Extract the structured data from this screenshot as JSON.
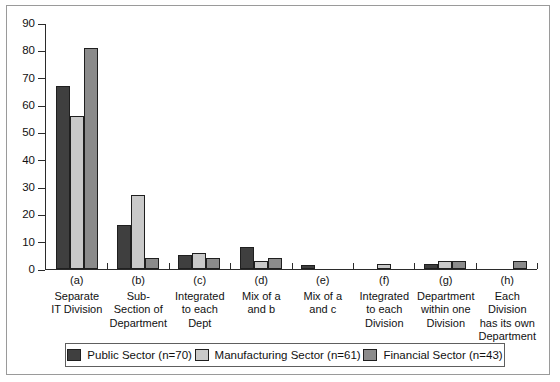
{
  "chart_data": {
    "type": "bar",
    "title": "",
    "xlabel": "",
    "ylabel": "",
    "ylim": [
      0,
      90
    ],
    "ytick_step": 10,
    "yticks": [
      0,
      10,
      20,
      30,
      40,
      50,
      60,
      70,
      80,
      90
    ],
    "grid": false,
    "legend_position": "bottom",
    "categories": [
      "(a) Separate IT Division",
      "(b) Sub-Section of Department",
      "(c) Integrated to each Dept",
      "(d) Mix of a and b",
      "(e) Mix of a and c",
      "(f) Integrated to each Division",
      "(g) Department within one Division",
      "(h) Each Division has its own Department"
    ],
    "category_codes": [
      "(a)",
      "(b)",
      "(c)",
      "(d)",
      "(e)",
      "(f)",
      "(g)",
      "(h)"
    ],
    "category_names": [
      "Separate\nIT Division",
      "Sub-\nSection of\nDepartment",
      "Integrated\nto each\nDept",
      "Mix of a\nand b",
      "Mix of a\nand c",
      "Integrated\nto each\nDivision",
      "Department\nwithin one\nDivision",
      "Each\nDivision\nhas its own\nDepartment"
    ],
    "series": [
      {
        "name": "Public Sector (n=70)",
        "color": "#3f3f3f",
        "values": [
          67,
          16,
          5,
          8,
          1.5,
          0,
          2,
          0
        ]
      },
      {
        "name": "Manufacturing Sector (n=61)",
        "color": "#c9c9c9",
        "values": [
          56,
          27,
          6,
          3,
          0,
          2,
          3,
          0
        ]
      },
      {
        "name": "Financial Sector (n=43)",
        "color": "#8b8b8b",
        "values": [
          81,
          4,
          4,
          4,
          0,
          0,
          3,
          3
        ]
      }
    ]
  },
  "legend": {
    "items": [
      {
        "label": "Public Sector (n=70)"
      },
      {
        "label": "Manufacturing Sector (n=61)"
      },
      {
        "label": "Financial Sector (n=43)"
      }
    ]
  },
  "axis": {
    "y_tick_labels": [
      "0",
      "10",
      "20",
      "30",
      "40",
      "50",
      "60",
      "70",
      "80",
      "90"
    ]
  },
  "x_labels": [
    {
      "code": "(a)",
      "lines": [
        "Separate",
        "IT Division"
      ]
    },
    {
      "code": "(b)",
      "lines": [
        "Sub-",
        "Section of",
        "Department"
      ]
    },
    {
      "code": "(c)",
      "lines": [
        "Integrated",
        "to each",
        "Dept"
      ]
    },
    {
      "code": "(d)",
      "lines": [
        "Mix of a",
        "and b"
      ]
    },
    {
      "code": "(e)",
      "lines": [
        "Mix of a",
        "and c"
      ]
    },
    {
      "code": "(f)",
      "lines": [
        "Integrated",
        "to each",
        "Division"
      ]
    },
    {
      "code": "(g)",
      "lines": [
        "Department",
        "within one",
        "Division"
      ]
    },
    {
      "code": "(h)",
      "lines": [
        "Each",
        "Division",
        "has its own",
        "Department"
      ]
    }
  ]
}
